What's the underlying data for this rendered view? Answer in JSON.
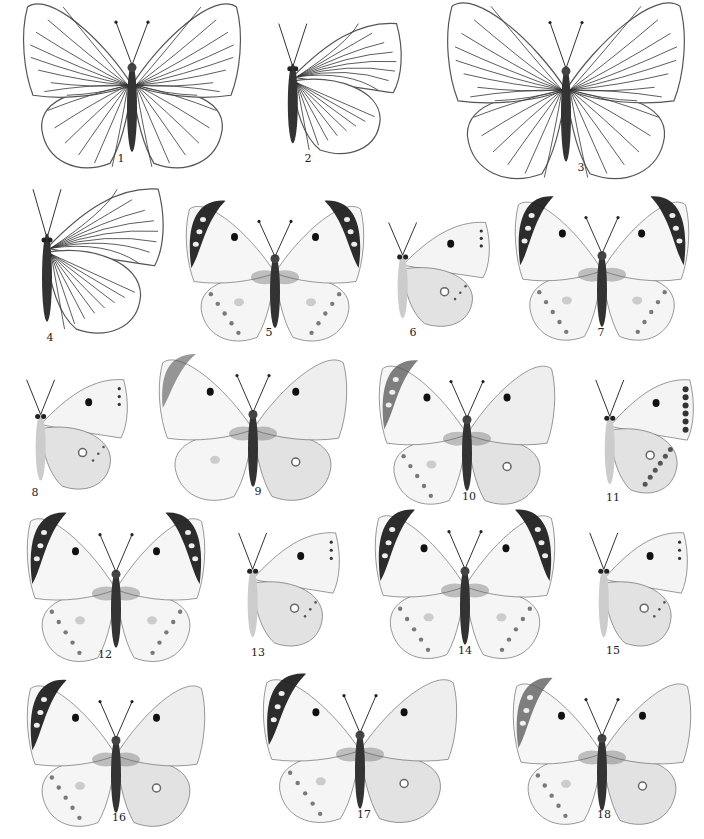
{
  "plate": {
    "title": "Butterfly illustration plate",
    "figures": [
      {
        "num": "1",
        "type": "upperside",
        "style": "veined",
        "x": 22,
        "y": 18,
        "w": 220,
        "h": 140,
        "label_x": 121,
        "label_y": 158
      },
      {
        "num": "2",
        "type": "underside",
        "style": "veined",
        "x": 262,
        "y": 18,
        "w": 140,
        "h": 140,
        "label_x": 308,
        "label_y": 158
      },
      {
        "num": "3",
        "type": "upperside",
        "style": "veined",
        "x": 446,
        "y": 18,
        "w": 240,
        "h": 150,
        "label_x": 581,
        "label_y": 167
      },
      {
        "num": "4",
        "type": "underside",
        "style": "veined",
        "x": 14,
        "y": 183,
        "w": 150,
        "h": 155,
        "label_x": 50,
        "label_y": 337
      },
      {
        "num": "5",
        "type": "upperside",
        "style": "tipped",
        "x": 185,
        "y": 218,
        "w": 180,
        "h": 115,
        "label_x": 269,
        "label_y": 332
      },
      {
        "num": "6",
        "type": "underside",
        "style": "plain",
        "x": 378,
        "y": 218,
        "w": 112,
        "h": 112,
        "label_x": 413,
        "label_y": 332
      },
      {
        "num": "7",
        "type": "upperside",
        "style": "tipped",
        "x": 514,
        "y": 214,
        "w": 176,
        "h": 118,
        "label_x": 601,
        "label_y": 332
      },
      {
        "num": "8",
        "type": "underside",
        "style": "plain",
        "x": 16,
        "y": 375,
        "w": 112,
        "h": 118,
        "label_x": 35,
        "label_y": 492
      },
      {
        "num": "9",
        "type": "split",
        "style": "faint",
        "x": 158,
        "y": 372,
        "w": 190,
        "h": 120,
        "label_x": 258,
        "label_y": 491
      },
      {
        "num": "10",
        "type": "split",
        "style": "clouded",
        "x": 378,
        "y": 378,
        "w": 178,
        "h": 118,
        "label_x": 469,
        "label_y": 496
      },
      {
        "num": "11",
        "type": "underside",
        "style": "spotted",
        "x": 586,
        "y": 375,
        "w": 108,
        "h": 122,
        "label_x": 613,
        "label_y": 497
      },
      {
        "num": "12",
        "type": "upperside",
        "style": "tipped",
        "x": 26,
        "y": 531,
        "w": 180,
        "h": 122,
        "label_x": 105,
        "label_y": 654
      },
      {
        "num": "13",
        "type": "underside",
        "style": "plain",
        "x": 228,
        "y": 528,
        "w": 112,
        "h": 122,
        "label_x": 258,
        "label_y": 652
      },
      {
        "num": "14",
        "type": "upperside",
        "style": "tipped",
        "x": 374,
        "y": 528,
        "w": 182,
        "h": 122,
        "label_x": 465,
        "label_y": 650
      },
      {
        "num": "15",
        "type": "underside",
        "style": "plain",
        "x": 580,
        "y": 528,
        "w": 108,
        "h": 122,
        "label_x": 613,
        "label_y": 650
      },
      {
        "num": "16",
        "type": "split",
        "style": "tipped",
        "x": 26,
        "y": 698,
        "w": 180,
        "h": 120,
        "label_x": 119,
        "label_y": 817
      },
      {
        "num": "17",
        "type": "split",
        "style": "tipped",
        "x": 262,
        "y": 692,
        "w": 196,
        "h": 122,
        "label_x": 364,
        "label_y": 814
      },
      {
        "num": "18",
        "type": "split",
        "style": "clouded",
        "x": 512,
        "y": 696,
        "w": 180,
        "h": 120,
        "label_x": 604,
        "label_y": 814
      }
    ]
  }
}
